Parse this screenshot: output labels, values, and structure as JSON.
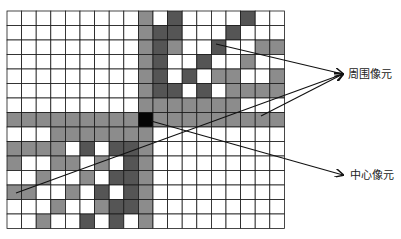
{
  "diagram": {
    "title": "",
    "grid": {
      "cols": 19,
      "rows": 15,
      "origin": [
        7,
        11
      ],
      "cell_w": 14.6,
      "cell_h": 14.5,
      "palette": {
        "0": "#ffffff",
        "1": "#8c8c8c",
        "2": "#555555",
        "3": "#050505"
      },
      "center_cell": {
        "row": 7,
        "col": 9
      },
      "cells": [
        [
          0,
          0,
          0,
          0,
          0,
          0,
          0,
          0,
          0,
          1,
          0,
          2,
          0,
          0,
          0,
          0,
          2,
          0,
          0
        ],
        [
          0,
          0,
          0,
          0,
          0,
          0,
          0,
          0,
          0,
          1,
          2,
          2,
          0,
          0,
          0,
          2,
          0,
          0,
          0
        ],
        [
          0,
          0,
          0,
          0,
          0,
          0,
          0,
          0,
          0,
          1,
          2,
          1,
          0,
          0,
          2,
          0,
          0,
          1,
          1
        ],
        [
          0,
          0,
          0,
          0,
          0,
          0,
          0,
          0,
          0,
          1,
          2,
          0,
          0,
          2,
          0,
          0,
          1,
          0,
          0
        ],
        [
          0,
          0,
          0,
          0,
          0,
          0,
          0,
          0,
          0,
          1,
          2,
          0,
          2,
          0,
          1,
          1,
          0,
          0,
          1
        ],
        [
          0,
          0,
          0,
          0,
          0,
          0,
          0,
          0,
          0,
          1,
          2,
          2,
          0,
          2,
          0,
          1,
          1,
          1,
          1
        ],
        [
          0,
          0,
          0,
          0,
          0,
          0,
          0,
          0,
          0,
          1,
          1,
          1,
          1,
          1,
          1,
          1,
          0,
          0,
          0
        ],
        [
          1,
          1,
          1,
          1,
          1,
          1,
          1,
          1,
          1,
          3,
          1,
          1,
          1,
          1,
          1,
          1,
          1,
          1,
          1
        ],
        [
          0,
          0,
          0,
          1,
          1,
          1,
          1,
          1,
          1,
          1,
          0,
          0,
          0,
          0,
          0,
          0,
          0,
          0,
          0
        ],
        [
          1,
          1,
          1,
          1,
          0,
          2,
          0,
          2,
          2,
          1,
          0,
          0,
          0,
          0,
          0,
          0,
          0,
          0,
          0
        ],
        [
          1,
          0,
          0,
          1,
          1,
          0,
          1,
          0,
          2,
          1,
          0,
          0,
          0,
          0,
          0,
          0,
          0,
          0,
          0
        ],
        [
          0,
          0,
          1,
          0,
          0,
          1,
          0,
          2,
          2,
          1,
          0,
          0,
          0,
          0,
          0,
          0,
          0,
          0,
          0
        ],
        [
          1,
          1,
          0,
          0,
          1,
          0,
          2,
          0,
          2,
          1,
          0,
          0,
          0,
          0,
          0,
          0,
          0,
          0,
          0
        ],
        [
          0,
          0,
          0,
          1,
          0,
          0,
          1,
          2,
          2,
          1,
          0,
          0,
          0,
          0,
          0,
          0,
          0,
          0,
          0
        ],
        [
          0,
          0,
          1,
          0,
          0,
          2,
          0,
          2,
          0,
          1,
          0,
          0,
          0,
          0,
          0,
          0,
          0,
          0,
          0
        ]
      ]
    },
    "labels": {
      "surrounding": "周围像元",
      "center": "中心像元"
    },
    "arrows": [
      {
        "name": "arrow-surrounding-from-top-cluster",
        "from": [
          216,
          44
        ],
        "to": [
          343,
          74
        ]
      },
      {
        "name": "arrow-surrounding-from-bottom-left",
        "from": [
          16,
          193
        ],
        "to": [
          343,
          74
        ]
      },
      {
        "name": "arrow-surrounding-from-right-band",
        "from": [
          261,
          116
        ],
        "to": [
          343,
          74
        ]
      },
      {
        "name": "arrow-center-from-center-pixel",
        "from": [
          151,
          121
        ],
        "to": [
          343,
          175
        ]
      }
    ]
  }
}
